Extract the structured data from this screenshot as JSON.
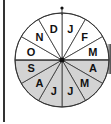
{
  "diagram": {
    "type": "month-wheel",
    "months": [
      "J",
      "F",
      "M",
      "A",
      "M",
      "J",
      "J",
      "A",
      "S",
      "O",
      "N",
      "D"
    ],
    "shaded_months_indices": [
      3,
      4,
      5,
      6,
      7,
      8
    ],
    "shaded_color": "#d3d3d3",
    "unshaded_color": "#ffffff",
    "line_color": "#333333",
    "center": [
      62,
      60
    ],
    "radius": 47,
    "top_marker": "dot"
  }
}
